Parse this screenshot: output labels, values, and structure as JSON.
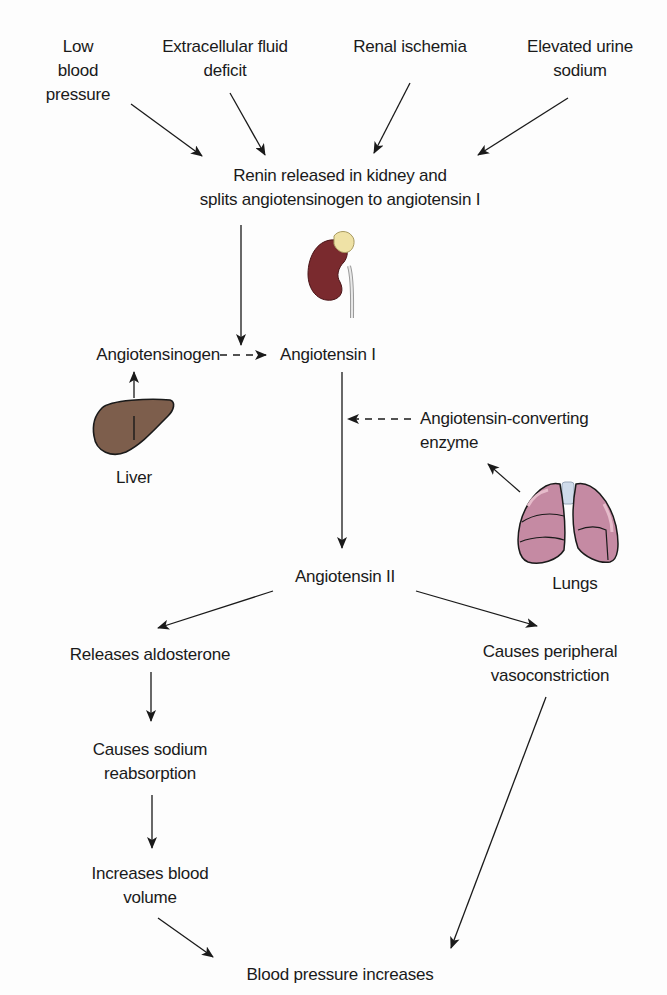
{
  "diagram": {
    "triggers": [
      {
        "lines": [
          "Low",
          "blood",
          "pressure"
        ]
      },
      {
        "lines": [
          "Extracellular fluid",
          "deficit"
        ]
      },
      {
        "lines": [
          "Renal ischemia"
        ]
      },
      {
        "lines": [
          "Elevated urine",
          "sodium"
        ]
      }
    ],
    "renin": {
      "lines": [
        "Renin released in kidney and",
        "splits angiotensinogen to angiotensin I"
      ]
    },
    "angiotensinogen": "Angiotensinogen",
    "angiotensin_1": "Angiotensin I",
    "liver_label": "Liver",
    "ace": {
      "lines": [
        "Angiotensin-converting",
        "enzyme"
      ]
    },
    "lungs_label": "Lungs",
    "angiotensin_2": "Angiotensin II",
    "left_branch": {
      "aldosterone": "Releases aldosterone",
      "sodium": {
        "lines": [
          "Causes sodium",
          "reabsorption"
        ]
      },
      "volume": {
        "lines": [
          "Increases blood",
          "volume"
        ]
      }
    },
    "right_branch": {
      "vasoconstriction": {
        "lines": [
          "Causes peripheral",
          "vasoconstriction"
        ]
      }
    },
    "outcome": "Blood pressure increases",
    "icons": [
      "kidney-icon",
      "liver-icon",
      "lungs-icon"
    ],
    "colors": {
      "text": "#1a1a1a",
      "kidney": "#7a2a2e",
      "adrenal": "#efe2a6",
      "liver": "#7d5e4c",
      "lungs": "#c58aa3",
      "trachea": "#cfdbea"
    }
  }
}
